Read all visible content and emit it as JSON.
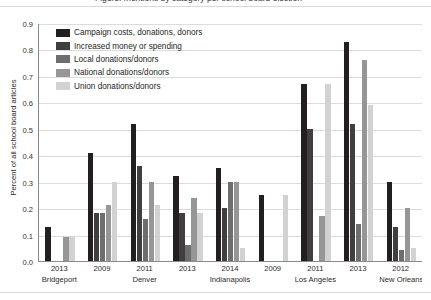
{
  "title_partial": "Figure: mentions by category per school board election",
  "legend": {
    "items": [
      {
        "label": "Campaign costs, donations, donors",
        "color": "#231f20",
        "key": "campaign_costs"
      },
      {
        "label": "Increased money or spending",
        "color": "#3f3f3f",
        "key": "increased_money"
      },
      {
        "label": "Local donations/donors",
        "color": "#6e6e6e",
        "key": "local"
      },
      {
        "label": "National donations/donors",
        "color": "#969696",
        "key": "national"
      },
      {
        "label": "Union donations/donors",
        "color": "#d2d2d2",
        "key": "union"
      }
    ]
  },
  "axes": {
    "ylabel": "Percent of all school board articles",
    "yticks": [
      "0.0",
      "0.1",
      "0.2",
      "0.3",
      "0.4",
      "0.5",
      "0.6",
      "0.7",
      "0.8",
      "0.9"
    ],
    "ymin": 0.0,
    "ymax": 0.9,
    "xlabel": ""
  },
  "chart_data": {
    "type": "bar",
    "title": "Figure: mentions by category per school board election",
    "xlabel": "",
    "ylabel": "Percent of all school board articles",
    "ylim": [
      0.0,
      0.9
    ],
    "grid": true,
    "legend_position": "upper-left inside",
    "categories": [
      "2013",
      "2009",
      "2011",
      "2013",
      "2014",
      "2009",
      "2011",
      "2013",
      "2012"
    ],
    "cities": [
      "Bridgeport",
      "Denver",
      "Denver",
      "Denver",
      "Indianapolis",
      "Los Angeles",
      "Los Angeles",
      "Los Angeles",
      "New Orleans"
    ],
    "city_spans": [
      {
        "city": "Bridgeport",
        "groups": [
          "2013"
        ]
      },
      {
        "city": "Denver",
        "groups": [
          "2009",
          "2011",
          "2013"
        ]
      },
      {
        "city": "Indianapolis",
        "groups": [
          "2014"
        ]
      },
      {
        "city": "Los Angeles",
        "groups": [
          "2009",
          "2011",
          "2013"
        ]
      },
      {
        "city": "New Orleans",
        "groups": [
          "2012"
        ]
      }
    ],
    "series": [
      {
        "name": "Campaign costs, donations, donors",
        "color": "#231f20",
        "values": [
          0.13,
          0.41,
          0.52,
          0.32,
          0.35,
          0.25,
          0.67,
          0.83,
          0.3
        ]
      },
      {
        "name": "Increased money or spending",
        "color": "#3f3f3f",
        "values": [
          0.0,
          0.18,
          0.36,
          0.18,
          0.2,
          0.0,
          0.5,
          0.52,
          0.13
        ]
      },
      {
        "name": "Local donations/donors",
        "color": "#6e6e6e",
        "values": [
          0.0,
          0.18,
          0.16,
          0.06,
          0.3,
          0.0,
          0.0,
          0.14,
          0.04
        ]
      },
      {
        "name": "National donations/donors",
        "color": "#969696",
        "values": [
          0.09,
          0.21,
          0.3,
          0.24,
          0.3,
          0.0,
          0.17,
          0.76,
          0.2
        ]
      },
      {
        "name": "Union donations/donors",
        "color": "#d2d2d2",
        "values": [
          0.09,
          0.3,
          0.21,
          0.18,
          0.05,
          0.25,
          0.67,
          0.59,
          0.05
        ]
      }
    ]
  }
}
